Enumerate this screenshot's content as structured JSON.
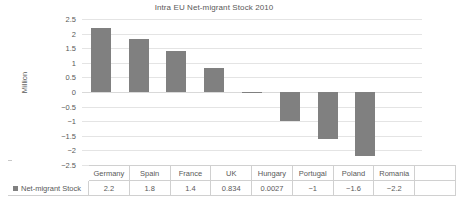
{
  "chart_data": {
    "type": "bar",
    "title": "Intra EU Net-migrant Stock 2010",
    "xlabel": "",
    "ylabel": "Million",
    "categories": [
      "Germany",
      "Spain",
      "France",
      "UK",
      "Hungary",
      "Portugal",
      "Poland",
      "Romania"
    ],
    "values": [
      2.2,
      1.8,
      1.4,
      0.834,
      0.0027,
      -1,
      -1.6,
      -2.2
    ],
    "value_labels": [
      "2.2",
      "1.8",
      "1.4",
      "0.834",
      "0.0027",
      "−1",
      "−1.6",
      "−2.2"
    ],
    "series": [
      {
        "name": "Net-migrant Stock",
        "values": [
          2.2,
          1.8,
          1.4,
          0.834,
          0.0027,
          -1,
          -1.6,
          -2.2
        ],
        "color": "#808080"
      }
    ],
    "ylim": [
      -2.5,
      2.5
    ],
    "ytick_values": [
      2.5,
      2,
      1.5,
      1,
      0.5,
      0,
      -0.5,
      -1,
      -1.5,
      -2,
      -2.5
    ],
    "ytick_labels": [
      "2.5",
      "2",
      "1.5",
      "1",
      "0.5",
      "0",
      "−0.5",
      "−1",
      "−1.5",
      "−2",
      "−2.5"
    ],
    "grid": true,
    "legend_position": "data-table-left",
    "has_data_table": true
  },
  "legend": {
    "series_label": "Net-migrant Stock",
    "swatch_color": "#808080"
  },
  "table": {
    "empty_cell": "",
    "columns": [
      "Germany",
      "Spain",
      "France",
      "UK",
      "Hungary",
      "Portugal",
      "Poland",
      "Romania"
    ],
    "values": [
      "2.2",
      "1.8",
      "1.4",
      "0.834",
      "0.0027",
      "−1",
      "−1.6",
      "−2.2"
    ]
  },
  "colors": {
    "bar": "#808080",
    "gridline": "#e4e4e4",
    "text": "#595959",
    "table_border": "#d0d0d0",
    "background": "#ffffff"
  }
}
